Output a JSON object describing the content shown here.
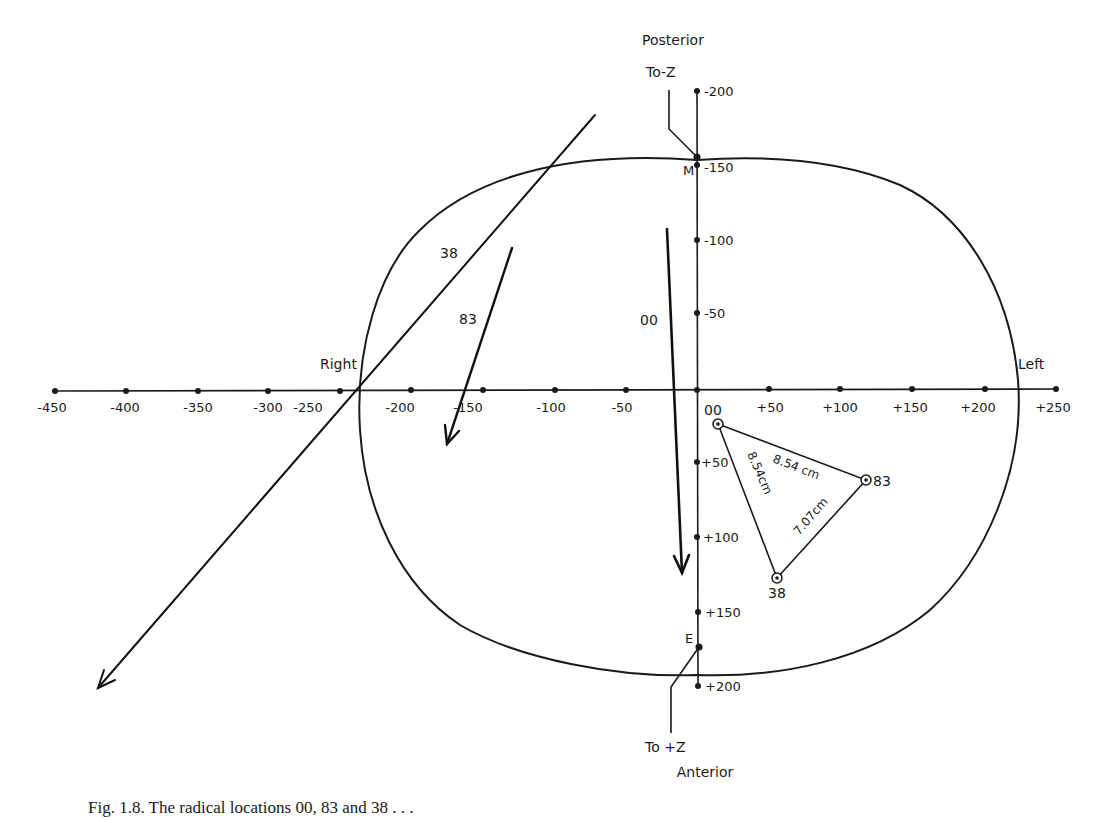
{
  "figure": {
    "type": "coordinate-diagram",
    "x_axis": {
      "ticks": [
        {
          "value": -450,
          "label": "-450"
        },
        {
          "value": -400,
          "label": "-400"
        },
        {
          "value": -350,
          "label": "-350"
        },
        {
          "value": -300,
          "label": "-300"
        },
        {
          "value": -250,
          "label": "-250"
        },
        {
          "value": -200,
          "label": "-200"
        },
        {
          "value": -150,
          "label": "-150"
        },
        {
          "value": -100,
          "label": "-100"
        },
        {
          "value": -50,
          "label": "-50"
        },
        {
          "value": 50,
          "label": "+50"
        },
        {
          "value": 100,
          "label": "+100"
        },
        {
          "value": 150,
          "label": "+150"
        },
        {
          "value": 200,
          "label": "+200"
        },
        {
          "value": 250,
          "label": "+250"
        }
      ],
      "left_label": "Right",
      "right_label": "Left"
    },
    "y_axis": {
      "ticks": [
        {
          "value": -200,
          "label": "-200"
        },
        {
          "value": -150,
          "label": "-150"
        },
        {
          "value": -100,
          "label": "-100"
        },
        {
          "value": -50,
          "label": "-50"
        },
        {
          "value": 50,
          "label": "+50"
        },
        {
          "value": 100,
          "label": "+100"
        },
        {
          "value": 150,
          "label": "+150"
        },
        {
          "value": 200,
          "label": "+200"
        }
      ],
      "top_label": "Posterior",
      "bottom_label": "Anterior"
    },
    "markers": {
      "top_point": "M",
      "bottom_point": "E",
      "top_leader": "To-Z",
      "bottom_leader": "To +Z"
    },
    "arrows": [
      {
        "label": "38"
      },
      {
        "label": "83"
      },
      {
        "label": "00"
      }
    ],
    "triangle": {
      "points": [
        {
          "label": "00"
        },
        {
          "label": "83"
        },
        {
          "label": "38"
        }
      ],
      "distances": [
        {
          "between": "00-83",
          "label": "8.54 cm"
        },
        {
          "between": "00-38",
          "label": "8.54cm"
        },
        {
          "between": "83-38",
          "label": "7.07cm"
        }
      ]
    }
  },
  "caption": "Fig. 1.8.   The radical locations 00, 83 and 38 . . ."
}
